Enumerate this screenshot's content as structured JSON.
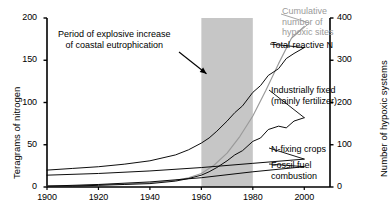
{
  "chart_data": {
    "type": "line",
    "title": "",
    "xlabel": "",
    "ylabel": "Teragrams of nitrogen",
    "y2label": "Number of hypoxic systems",
    "xlim": [
      1900,
      2010
    ],
    "ylim": [
      0,
      200
    ],
    "y2lim": [
      0,
      400
    ],
    "grid": false,
    "legend_position": "inline-right-labels",
    "xticks": [
      1900,
      1920,
      1940,
      1960,
      1980,
      2000
    ],
    "yticks": [
      0,
      50,
      100,
      150,
      200
    ],
    "y2ticks": [
      0,
      100,
      200,
      300,
      400
    ],
    "shaded_band": {
      "x_start": 1960,
      "x_end": 1980,
      "color": "#c6c6c6",
      "label": "Period of explosive increase of coastal eutrophication"
    },
    "annotations": [
      {
        "name": "eutrophication-note",
        "line1": "Period of explosive increase",
        "line2": "of coastal eutrophication",
        "arrow_to_x": 1962,
        "arrow_to_y": 134
      }
    ],
    "series": [
      {
        "name": "Cumulative number of hypoxic sites",
        "label_lines": [
          "Cumulative",
          "number of",
          "hypoxic sites"
        ],
        "color": "#9a9a9a",
        "axis": "right",
        "x": [
          1900,
          1910,
          1920,
          1930,
          1940,
          1950,
          1955,
          1960,
          1965,
          1970,
          1975,
          1980,
          1985,
          1990,
          1995,
          2000
        ],
        "values": [
          2,
          3,
          5,
          7,
          10,
          16,
          22,
          32,
          52,
          80,
          120,
          168,
          228,
          292,
          352,
          380
        ]
      },
      {
        "name": "Total reactive N",
        "label_lines": [
          "Total reactive N"
        ],
        "color": "#000000",
        "axis": "left",
        "x": [
          1900,
          1910,
          1920,
          1930,
          1940,
          1950,
          1955,
          1960,
          1963,
          1966,
          1970,
          1973,
          1976,
          1980,
          1983,
          1986,
          1990,
          1993,
          1996,
          2000
        ],
        "values": [
          20,
          22,
          24,
          27,
          31,
          38,
          44,
          52,
          58,
          66,
          78,
          88,
          96,
          112,
          120,
          132,
          140,
          152,
          158,
          165
        ]
      },
      {
        "name": "Industrially fixed (mainly fertilizer)",
        "label_lines": [
          "Industrially fixed",
          "(mainly fertilizer)"
        ],
        "color": "#000000",
        "axis": "left",
        "x": [
          1900,
          1910,
          1920,
          1930,
          1940,
          1950,
          1955,
          1960,
          1963,
          1966,
          1970,
          1973,
          1976,
          1980,
          1983,
          1986,
          1990,
          1993,
          1996,
          2000
        ],
        "values": [
          1,
          1,
          2,
          3,
          4,
          7,
          10,
          14,
          18,
          23,
          31,
          38,
          43,
          54,
          58,
          68,
          72,
          70,
          78,
          82
        ]
      },
      {
        "name": "N-fixing crops",
        "label_lines": [
          "N-fixing crops"
        ],
        "color": "#000000",
        "axis": "left",
        "x": [
          1900,
          1920,
          1940,
          1960,
          1980,
          2000
        ],
        "values": [
          14,
          16,
          19,
          23,
          28,
          33
        ]
      },
      {
        "name": "Fossil fuel combustion",
        "label_lines": [
          "Fossil fuel",
          "combustion"
        ],
        "color": "#000000",
        "axis": "left",
        "x": [
          1900,
          1920,
          1940,
          1960,
          1980,
          2000
        ],
        "values": [
          1,
          3,
          6,
          11,
          18,
          24
        ]
      }
    ]
  },
  "axes": {
    "left_title": "Teragrams of nitrogen",
    "right_title": "Number of hypoxic systems",
    "y_left_ticks": [
      "200",
      "150",
      "100",
      "50",
      "0"
    ],
    "y_right_ticks": [
      "400",
      "300",
      "200",
      "100",
      "0"
    ],
    "x_ticks": [
      "1900",
      "1920",
      "1940",
      "1960",
      "1980",
      "2000"
    ]
  },
  "annotation": {
    "line1": "Period of explosive increase",
    "line2": "of coastal eutrophication"
  },
  "labels": {
    "hypoxic_l1": "Cumulative",
    "hypoxic_l2": "number of",
    "hypoxic_l3": "hypoxic sites",
    "total_reactive_n": "Total reactive N",
    "industrial_l1": "Industrially fixed",
    "industrial_l2": "(mainly fertilizer)",
    "n_fixing_crops": "N-fixing crops",
    "fossil_l1": "Fossil fuel",
    "fossil_l2": "combustion"
  },
  "colors": {
    "band": "#c6c6c6",
    "grey_series": "#9a9a9a",
    "axis": "#000000"
  }
}
